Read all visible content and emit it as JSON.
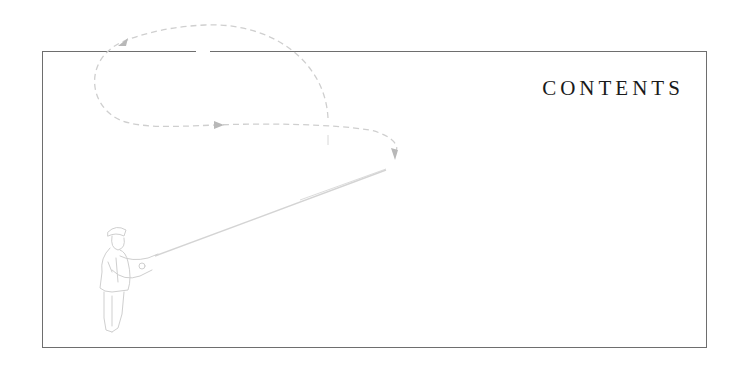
{
  "page": {
    "heading": "CONTENTS"
  },
  "illustration": {
    "subject": "fly-fisherman-casting",
    "line_color": "#c8c8c8",
    "arrow_color": "#b4b4b4"
  },
  "icons": {
    "loop_arrows": "arrowhead-icon"
  }
}
